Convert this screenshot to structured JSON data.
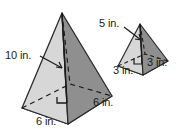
{
  "figure": {
    "background_color": "#ffffff",
    "colors": {
      "face_light": "#d4d4d4",
      "face_dark": "#8f8f8f",
      "base_light": "#cfcfcf",
      "outline": "#2b2b2b",
      "text": "#1a1a1a"
    }
  },
  "shapes": {
    "large_pyramid": {
      "name": "large-square-pyramid",
      "height_label": "10 in.",
      "base_front_label": "6 in.",
      "base_right_label": "6 in."
    },
    "small_pyramid": {
      "name": "small-square-pyramid",
      "height_label": "5 in.",
      "base_front_label": "3 in.",
      "base_right_label": "3 in."
    }
  },
  "labels": {
    "large_height": "10 in.",
    "large_base_front": "6 in.",
    "large_base_right": "6 in.",
    "small_height": "5 in.",
    "small_base_front": "3 in.",
    "small_base_right": "3 in."
  },
  "annotations": {
    "right_angle_marker": "right-angle-marker",
    "hidden_edge_style": "dashed",
    "leader_line": "leader-line"
  }
}
